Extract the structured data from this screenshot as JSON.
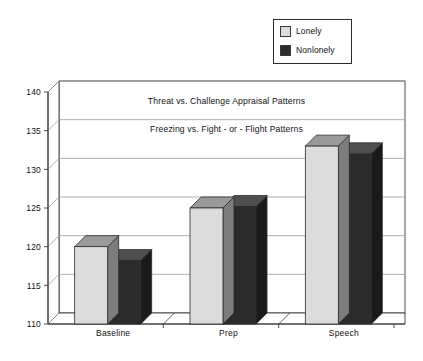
{
  "chart_data": {
    "type": "bar",
    "title": "",
    "subtitle": "",
    "xlabel": "",
    "ylabel": "",
    "categories": [
      "Baseline",
      "Prep",
      "Speech"
    ],
    "series": [
      {
        "name": "Lonely",
        "values": [
          120.0,
          125.0,
          133.0
        ],
        "color": "#dcdcdc"
      },
      {
        "name": "Nonlonely",
        "values": [
          118.2,
          125.2,
          132.0
        ],
        "color": "#2b2b2b"
      }
    ],
    "ylim": [
      110,
      140
    ],
    "ytick_values": [
      110,
      115,
      120,
      125,
      130,
      135,
      140
    ],
    "ytick_labels": [
      "110",
      "115",
      "120",
      "125",
      "130",
      "135",
      "140"
    ],
    "grid": true,
    "grid_axis": "y",
    "legend_position": "top-right",
    "three_d": true,
    "annotations": [
      {
        "text": "Threat vs. Challenge Appraisal Patterns",
        "x": 0.5,
        "y": 138.5
      },
      {
        "text": "Freezing vs. Fight - or - Flight Patterns",
        "x": 0.5,
        "y": 134.8
      }
    ]
  },
  "legend": {
    "items": [
      {
        "label": "Lonely",
        "swatch": "lonely"
      },
      {
        "label": "Nonlonely",
        "swatch": "nonlonely"
      }
    ]
  },
  "colors": {
    "lonely_front": "#dcdcdc",
    "lonely_top": "#9a9a9a",
    "lonely_side": "#7d7d7d",
    "nonlonely_front": "#2b2b2b",
    "nonlonely_top": "#4f4f4f",
    "nonlonely_side": "#1a1a1a",
    "floor": "#8f8f8f",
    "grid": "#9a9a9a",
    "axis": "#3a3a3a"
  }
}
